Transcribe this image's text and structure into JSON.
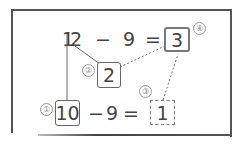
{
  "diagram": {
    "top_equation": {
      "minuend": "12",
      "minuend_tens_digit": "1",
      "minuend_ones_digit": "2",
      "operator": "−",
      "subtrahend": "9",
      "equals": "=",
      "result": "3"
    },
    "decomposed": {
      "ones_part": "2"
    },
    "bottom_equation": {
      "ten": "10",
      "operator": "−",
      "subtrahend": "9",
      "equals": "=",
      "result": "1"
    },
    "step_markers": [
      "①",
      "②",
      "③",
      "④"
    ],
    "colors": {
      "line": "#555555",
      "text": "#444444",
      "marker": "#888888"
    }
  }
}
